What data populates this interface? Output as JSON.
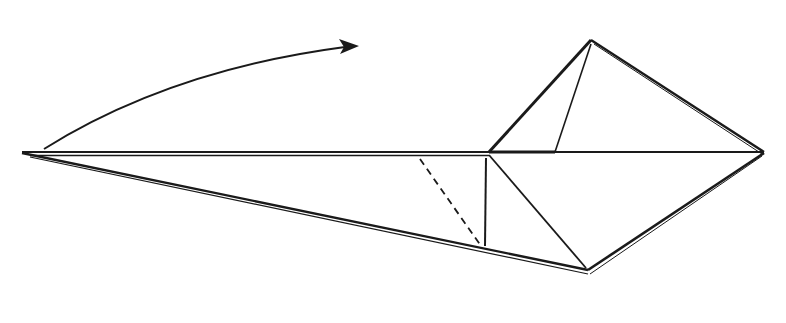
{
  "diagram": {
    "type": "origami-fold-step",
    "background": "#ffffff",
    "ink": "#1a1a1a",
    "points": {
      "left_tip": [
        22,
        153
      ],
      "arrow_start": [
        44,
        149
      ],
      "arrow_end": [
        358,
        46
      ],
      "top_peak": [
        591,
        40
      ],
      "right_tip": [
        764,
        153
      ],
      "bottom_peak": [
        588,
        272
      ],
      "mid_junction": [
        489,
        153
      ],
      "vertical_foot": [
        485,
        246
      ],
      "dash_top": [
        420,
        159
      ],
      "dash_bottom": [
        481,
        246
      ],
      "inner_crease_base": [
        555,
        152
      ]
    },
    "elements": [
      {
        "name": "arrow",
        "kind": "curved-arrow",
        "label": "fold direction"
      },
      {
        "name": "dashed-line",
        "kind": "valley-fold",
        "label": "valley fold line"
      }
    ]
  }
}
